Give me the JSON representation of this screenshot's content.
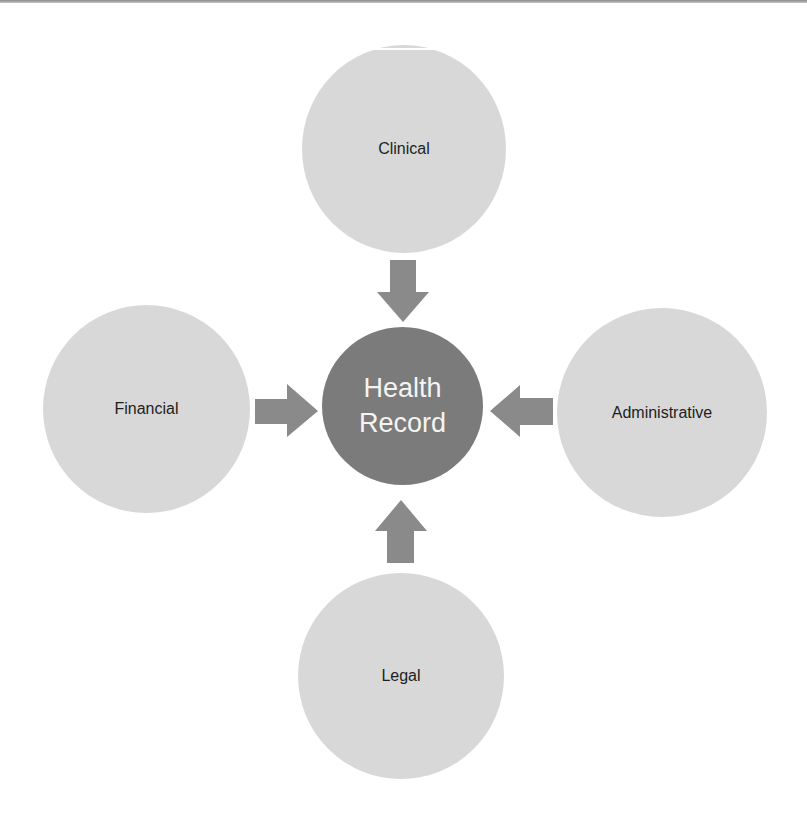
{
  "diagram": {
    "type": "hub-and-spoke",
    "colors": {
      "outer_fill": "#d8d8d8",
      "center_fill": "#7b7b7b",
      "arrow_fill": "#8a8a8a",
      "outer_text": "#1e1e1e",
      "center_text": "#f4f4f4"
    },
    "center": {
      "line1": "Health",
      "line2": "Record"
    },
    "nodes": [
      {
        "id": "clinical",
        "label": "Clinical",
        "position": "top",
        "arrow": "arrow-down"
      },
      {
        "id": "financial",
        "label": "Financial",
        "position": "left",
        "arrow": "arrow-right"
      },
      {
        "id": "administrative",
        "label": "Administrative",
        "position": "right",
        "arrow": "arrow-left"
      },
      {
        "id": "legal",
        "label": "Legal",
        "position": "bottom",
        "arrow": "arrow-up"
      }
    ]
  }
}
